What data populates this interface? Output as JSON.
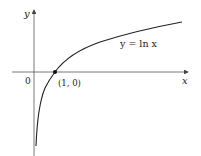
{
  "diagram": {
    "axes": {
      "x_label": "x",
      "y_label": "y",
      "origin_label": "0"
    },
    "curve": {
      "label": "y = ln x",
      "function": "ln x"
    },
    "point": {
      "label": "(1, 0)",
      "x": 1,
      "y": 0
    },
    "colors": {
      "line": "#222222",
      "axis": "#444444",
      "background": "#ffffff"
    }
  }
}
